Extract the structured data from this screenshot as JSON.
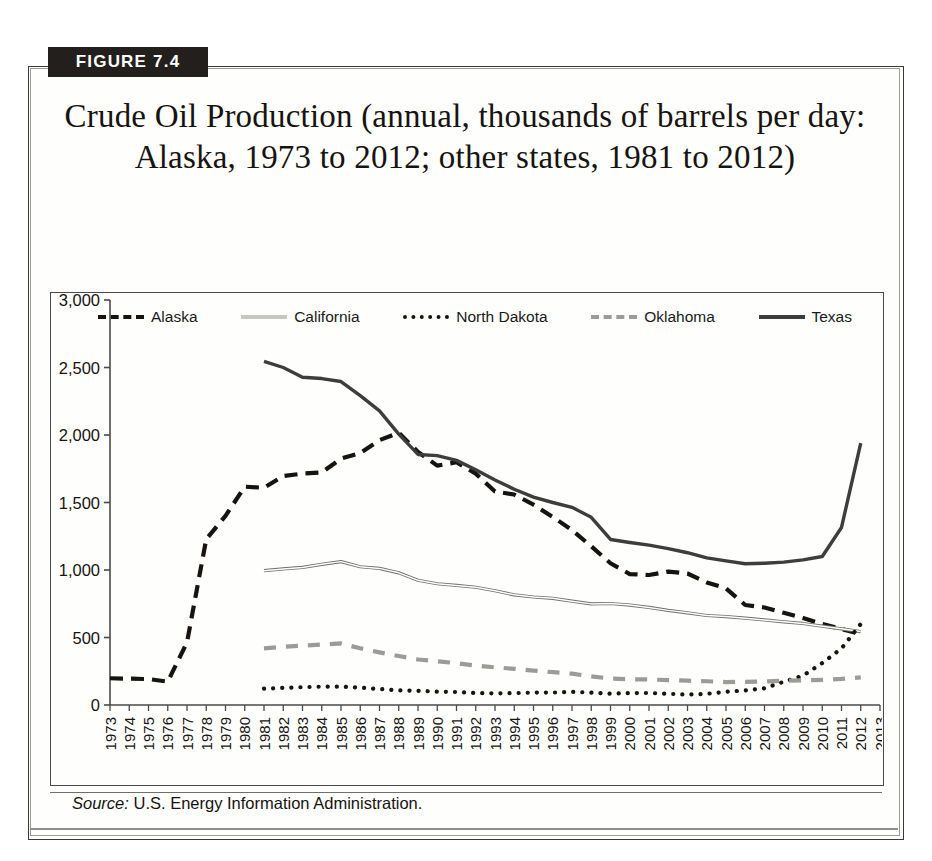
{
  "figure": {
    "banner_label": "FIGURE 7.4",
    "title": "Crude Oil Production (annual, thousands of barrels per day: Alaska, 1973 to 2012; other states, 1981 to 2012)",
    "source_keyword": "Source:",
    "source_text": "U.S. Energy Information Administration."
  },
  "legend": {
    "position": "top-inside",
    "items": [
      {
        "label": "Alaska",
        "style": "dashed",
        "color": "#17130f"
      },
      {
        "label": "California",
        "style": "thin-double",
        "color": "#8e8e8a"
      },
      {
        "label": "North Dakota",
        "style": "dotted",
        "color": "#17130f"
      },
      {
        "label": "Oklahoma",
        "style": "long-dash",
        "color": "#9b9b97"
      },
      {
        "label": "Texas",
        "style": "solid",
        "color": "#3d3d3b"
      }
    ]
  },
  "chart_data": {
    "type": "line",
    "title": "Crude Oil Production (annual, thousands of barrels per day: Alaska, 1973 to 2012; other states, 1981 to 2012)",
    "xlabel": "",
    "ylabel": "",
    "xlim": [
      1973,
      2013
    ],
    "ylim": [
      0,
      3000
    ],
    "grid": false,
    "legend_position": "top-inside",
    "ytick_labels": [
      "0",
      "500",
      "1,000",
      "1,500",
      "2,000",
      "2,500",
      "3,000"
    ],
    "ytick_values": [
      0,
      500,
      1000,
      1500,
      2000,
      2500,
      3000
    ],
    "xtick_labels": [
      "1973",
      "1974",
      "1975",
      "1976",
      "1977",
      "1978",
      "1979",
      "1980",
      "1981",
      "1982",
      "1983",
      "1984",
      "1985",
      "1986",
      "1987",
      "1988",
      "1989",
      "1990",
      "1991",
      "1992",
      "1993",
      "1994",
      "1995",
      "1996",
      "1997",
      "1998",
      "1999",
      "2000",
      "2001",
      "2002",
      "2003",
      "2004",
      "2005",
      "2006",
      "2007",
      "2008",
      "2009",
      "2010",
      "2011",
      "2012",
      "2013"
    ],
    "x": [
      1973,
      1974,
      1975,
      1976,
      1977,
      1978,
      1979,
      1980,
      1981,
      1982,
      1983,
      1984,
      1985,
      1986,
      1987,
      1988,
      1989,
      1990,
      1991,
      1992,
      1993,
      1994,
      1995,
      1996,
      1997,
      1998,
      1999,
      2000,
      2001,
      2002,
      2003,
      2004,
      2005,
      2006,
      2007,
      2008,
      2009,
      2010,
      2011,
      2012
    ],
    "series": [
      {
        "name": "Alaska",
        "style": "dashed",
        "color": "#17130f",
        "x": [
          1973,
          1974,
          1975,
          1976,
          1977,
          1978,
          1979,
          1980,
          1981,
          1982,
          1983,
          1984,
          1985,
          1986,
          1987,
          1988,
          1989,
          1990,
          1991,
          1992,
          1993,
          1994,
          1995,
          1996,
          1997,
          1998,
          1999,
          2000,
          2001,
          2002,
          2003,
          2004,
          2005,
          2006,
          2007,
          2008,
          2009,
          2010,
          2011,
          2012
        ],
        "values": [
          198,
          195,
          192,
          173,
          464,
          1229,
          1401,
          1617,
          1609,
          1696,
          1714,
          1722,
          1825,
          1867,
          1962,
          2017,
          1874,
          1773,
          1798,
          1714,
          1582,
          1559,
          1484,
          1393,
          1296,
          1175,
          1050,
          970,
          963,
          988,
          974,
          908,
          864,
          741,
          722,
          683,
          645,
          600,
          563,
          526
        ]
      },
      {
        "name": "California",
        "style": "thin-double",
        "color": "#8e8e8a",
        "x": [
          1981,
          1982,
          1983,
          1984,
          1985,
          1986,
          1987,
          1988,
          1989,
          1990,
          1991,
          1992,
          1993,
          1994,
          1995,
          1996,
          1997,
          1998,
          1999,
          2000,
          2001,
          2002,
          2003,
          2004,
          2005,
          2006,
          2007,
          2008,
          2009,
          2010,
          2011,
          2012
        ],
        "values": [
          995,
          1008,
          1019,
          1042,
          1062,
          1024,
          1012,
          979,
          924,
          898,
          886,
          872,
          846,
          816,
          800,
          790,
          769,
          749,
          752,
          740,
          723,
          701,
          683,
          663,
          655,
          643,
          630,
          616,
          604,
          584,
          564,
          544
        ]
      },
      {
        "name": "North Dakota",
        "style": "dotted",
        "color": "#17130f",
        "x": [
          1981,
          1982,
          1983,
          1984,
          1985,
          1986,
          1987,
          1988,
          1989,
          1990,
          1991,
          1992,
          1993,
          1994,
          1995,
          1996,
          1997,
          1998,
          1999,
          2000,
          2001,
          2002,
          2003,
          2004,
          2005,
          2006,
          2007,
          2008,
          2009,
          2010,
          2011,
          2012
        ],
        "values": [
          121,
          127,
          132,
          136,
          136,
          128,
          119,
          108,
          105,
          99,
          96,
          89,
          86,
          88,
          92,
          92,
          97,
          92,
          84,
          88,
          89,
          83,
          77,
          83,
          98,
          108,
          124,
          172,
          217,
          310,
          419,
          600
        ]
      },
      {
        "name": "Oklahoma",
        "style": "long-dash",
        "color": "#9b9b97",
        "x": [
          1981,
          1982,
          1983,
          1984,
          1985,
          1986,
          1987,
          1988,
          1989,
          1990,
          1991,
          1992,
          1993,
          1994,
          1995,
          1996,
          1997,
          1998,
          1999,
          2000,
          2001,
          2002,
          2003,
          2004,
          2005,
          2006,
          2007,
          2008,
          2009,
          2010,
          2011,
          2012
        ],
        "values": [
          419,
          432,
          440,
          448,
          456,
          420,
          390,
          363,
          337,
          324,
          310,
          291,
          279,
          268,
          255,
          243,
          232,
          212,
          196,
          191,
          189,
          184,
          180,
          176,
          170,
          172,
          175,
          179,
          182,
          186,
          193,
          205
        ]
      },
      {
        "name": "Texas",
        "style": "solid",
        "color": "#3d3d3b",
        "x": [
          1981,
          1982,
          1983,
          1984,
          1985,
          1986,
          1987,
          1988,
          1989,
          1990,
          1991,
          1992,
          1993,
          1994,
          1995,
          1996,
          1997,
          1998,
          1999,
          2000,
          2001,
          2002,
          2003,
          2004,
          2005,
          2006,
          2007,
          2008,
          2009,
          2010,
          2011,
          2012
        ],
        "values": [
          2546,
          2500,
          2428,
          2418,
          2396,
          2292,
          2179,
          2006,
          1856,
          1847,
          1812,
          1742,
          1667,
          1598,
          1540,
          1500,
          1464,
          1390,
          1226,
          1204,
          1184,
          1158,
          1128,
          1090,
          1068,
          1046,
          1050,
          1058,
          1075,
          1100,
          1315,
          1940
        ]
      }
    ]
  }
}
